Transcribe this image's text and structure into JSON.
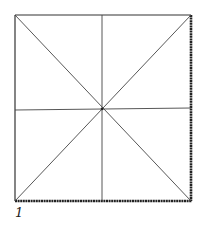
{
  "figure": {
    "label": "1",
    "square": {
      "x": 15,
      "y": 15,
      "width": 176,
      "height": 186
    },
    "stroke_color": "#333333",
    "heavy_edges": [
      "right",
      "bottom"
    ]
  }
}
